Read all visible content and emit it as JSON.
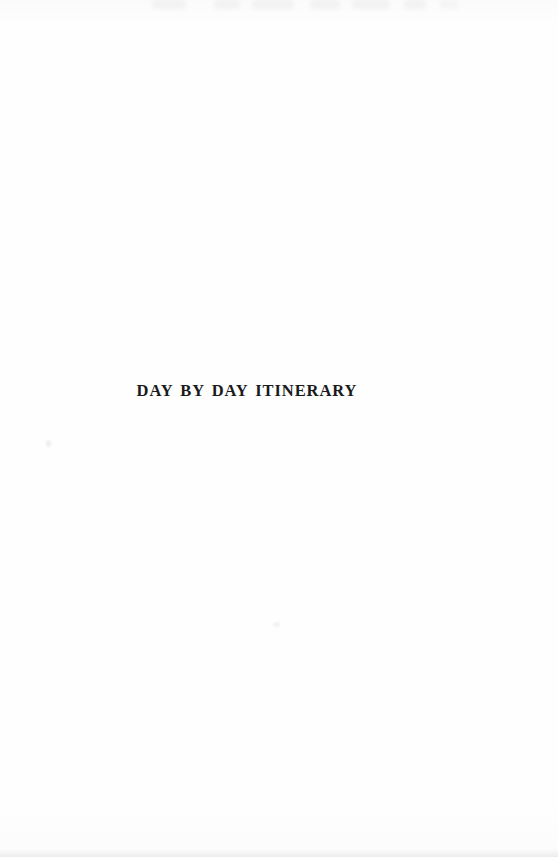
{
  "document": {
    "kind": "scanned-book-page",
    "page_type": "section-divider",
    "page_width": 558,
    "page_height": 857,
    "background_color": "#fefefe",
    "ink_color": "#1a1a1c"
  },
  "content": {
    "heading": "DAY BY DAY ITINERARY"
  },
  "artifacts": {
    "top_bleed_through": "faint gray smudges along top trim edge",
    "bottom_edge_shading": "subtle gray gradient along bottom trim edge",
    "specks": "two faint isolated scanner specks"
  }
}
